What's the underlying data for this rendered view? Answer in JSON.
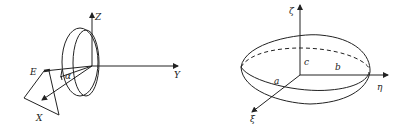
{
  "diagrams": [
    {
      "name": "antenna-coordinate-frame",
      "labels": {
        "z": "Z",
        "y": "Y",
        "x": "X",
        "e": "E",
        "alpha": "α"
      }
    },
    {
      "name": "ellipsoid",
      "labels": {
        "zeta": "ζ",
        "eta": "η",
        "xi": "ξ",
        "a": "a",
        "b": "b",
        "c": "c"
      }
    }
  ],
  "colors": {
    "stroke": "#222222",
    "background": "#ffffff"
  }
}
